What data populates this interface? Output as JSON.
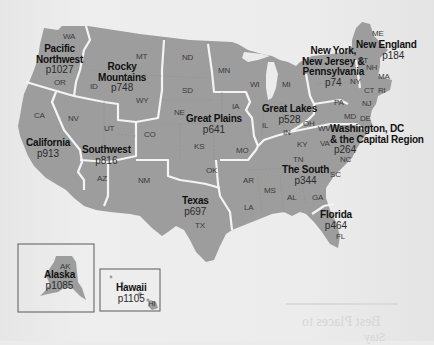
{
  "map": {
    "title": "Regions of the United States",
    "colors": {
      "background": "#ebebeb",
      "land": "#9d9d9d",
      "border": "#f4f4f4",
      "label": "#111111"
    },
    "regions": [
      {
        "id": "pacific-northwest",
        "name": "Pacific Northwest",
        "name_lines": [
          "Pacific",
          "Northwest"
        ],
        "page": "p1027"
      },
      {
        "id": "rocky-mountains",
        "name": "Rocky Mountains",
        "name_lines": [
          "Rocky",
          "Mountains"
        ],
        "page": "p748"
      },
      {
        "id": "california",
        "name": "California",
        "name_lines": [
          "California"
        ],
        "page": "p913"
      },
      {
        "id": "southwest",
        "name": "Southwest",
        "name_lines": [
          "Southwest"
        ],
        "page": "p816"
      },
      {
        "id": "great-plains",
        "name": "Great Plains",
        "name_lines": [
          "Great Plains"
        ],
        "page": "p641"
      },
      {
        "id": "texas",
        "name": "Texas",
        "name_lines": [
          "Texas"
        ],
        "page": "p697"
      },
      {
        "id": "great-lakes",
        "name": "Great Lakes",
        "name_lines": [
          "Great Lakes"
        ],
        "page": "p528"
      },
      {
        "id": "ny-nj-pa",
        "name": "New York, New Jersey & Pennsylvania",
        "name_lines": [
          "New York,",
          "New Jersey &",
          "Pennsylvania"
        ],
        "page": "p74"
      },
      {
        "id": "new-england",
        "name": "New England",
        "name_lines": [
          "New England"
        ],
        "page": "p184"
      },
      {
        "id": "washington-dc",
        "name": "Washington, DC & the Capital Region",
        "name_lines": [
          "Washington, DC",
          "& the Capital Region"
        ],
        "page": "p264"
      },
      {
        "id": "the-south",
        "name": "The South",
        "name_lines": [
          "The South"
        ],
        "page": "p344"
      },
      {
        "id": "florida",
        "name": "Florida",
        "name_lines": [
          "Florida"
        ],
        "page": "p464"
      },
      {
        "id": "alaska",
        "name": "Alaska",
        "name_lines": [
          "Alaska"
        ],
        "page": "p1085"
      },
      {
        "id": "hawaii",
        "name": "Hawaii",
        "name_lines": [
          "Hawaii"
        ],
        "page": "p1105"
      }
    ],
    "states": [
      "WA",
      "OR",
      "CA",
      "NV",
      "ID",
      "MT",
      "WY",
      "UT",
      "AZ",
      "CO",
      "NM",
      "ND",
      "SD",
      "NE",
      "KS",
      "OK",
      "TX",
      "MN",
      "IA",
      "MO",
      "AR",
      "LA",
      "WI",
      "IL",
      "MI",
      "IN",
      "OH",
      "KY",
      "TN",
      "MS",
      "AL",
      "GA",
      "FL",
      "SC",
      "NC",
      "VA",
      "WV",
      "MD",
      "DE",
      "PA",
      "NJ",
      "NY",
      "CT",
      "RI",
      "MA",
      "VT",
      "NH",
      "ME",
      "AK",
      "HI"
    ],
    "bleed_through_text": [
      "Best Places to",
      "Stay"
    ]
  }
}
